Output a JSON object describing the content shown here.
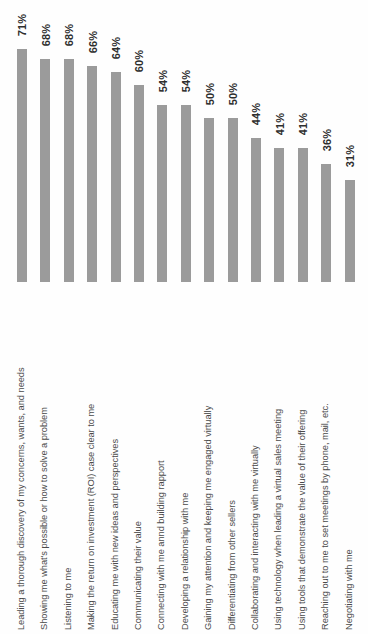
{
  "chart_data": {
    "type": "bar",
    "title": "",
    "subtitle": "",
    "xlabel": "",
    "ylabel": "",
    "ylim": [
      0,
      75
    ],
    "grid": false,
    "legend": "none",
    "orientation": "vertical-bars-rotated-labels",
    "bar_color": "#9b9b9b",
    "background_color": "#fefefe",
    "value_suffix": "%",
    "categories": [
      "Leading a thorough discovery of my concerns, wants, and needs",
      "Showing me what's possible or how to solve a problem",
      "Listening to me",
      "Making the return on investment (ROI) case clear to me",
      "Educating me with new ideas and perspectives",
      "Communicating their value",
      "Connecting with me annd building rapport",
      "Developing a relationship with me",
      "Gaining my attention and keeping me engaged virtually",
      "Differentiating from other sellers",
      "Collaborating and interacting with me virtually",
      "Using technology when leading a virtual sales meeting",
      "Using tools that demonstrate the value of their offering",
      "Reaching out to me to set meetings by phone, mail, etc.",
      "Negotiating with me"
    ],
    "values": [
      71,
      68,
      68,
      66,
      64,
      60,
      54,
      54,
      50,
      50,
      44,
      41,
      41,
      36,
      31
    ],
    "value_labels": [
      "71%",
      "68%",
      "68%",
      "66%",
      "64%",
      "60%",
      "54%",
      "54%",
      "50%",
      "50%",
      "44%",
      "41%",
      "41%",
      "36%",
      "31%"
    ]
  }
}
